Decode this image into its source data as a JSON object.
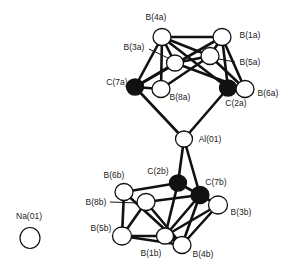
{
  "figure": {
    "type": "molecular-structure",
    "colors": {
      "bond": "#111111",
      "boron_fill": "#ffffff",
      "carbon_fill": "#111111",
      "stroke": "#111111"
    },
    "atoms": [
      {
        "id": "B4a",
        "label": "B(4a)",
        "element": "B",
        "x": 162,
        "y": 37,
        "r": 8.5,
        "lx": 156,
        "ly": 17
      },
      {
        "id": "B1a",
        "label": "B(1a)",
        "element": "B",
        "x": 222,
        "y": 37,
        "r": 8.5,
        "lx": 250,
        "ly": 35
      },
      {
        "id": "B3a",
        "label": "B(3a)",
        "element": "B",
        "x": 175,
        "y": 63,
        "r": 8,
        "lx": 134,
        "ly": 47
      },
      {
        "id": "B5a",
        "label": "B(5a)",
        "element": "B",
        "x": 210,
        "y": 56,
        "r": 8.5,
        "lx": 250,
        "ly": 62
      },
      {
        "id": "C7a",
        "label": "C(7a)",
        "element": "C",
        "x": 135,
        "y": 87,
        "r": 8,
        "lx": 117,
        "ly": 82
      },
      {
        "id": "B8a",
        "label": "B(8a)",
        "element": "B",
        "x": 161,
        "y": 89,
        "r": 8.5,
        "lx": 180,
        "ly": 97
      },
      {
        "id": "C2a",
        "label": "C(2a)",
        "element": "C",
        "x": 228,
        "y": 88,
        "r": 8,
        "lx": 236,
        "ly": 103
      },
      {
        "id": "B6a",
        "label": "B(6a)",
        "element": "B",
        "x": 245,
        "y": 89,
        "r": 8.5,
        "lx": 268,
        "ly": 93
      },
      {
        "id": "Al01",
        "label": "Al(01)",
        "element": "Al",
        "x": 184,
        "y": 139,
        "r": 8,
        "lx": 210,
        "ly": 139
      },
      {
        "id": "C2b",
        "label": "C(2b)",
        "element": "C",
        "x": 178,
        "y": 183,
        "r": 8,
        "lx": 158,
        "ly": 171
      },
      {
        "id": "C7b",
        "label": "C(7b)",
        "element": "C",
        "x": 200,
        "y": 195,
        "r": 8.5,
        "lx": 216,
        "ly": 182
      },
      {
        "id": "B3b",
        "label": "B(3b)",
        "element": "B",
        "x": 218,
        "y": 205,
        "r": 9,
        "lx": 241,
        "ly": 212
      },
      {
        "id": "B6b",
        "label": "B(6b)",
        "element": "B",
        "x": 124,
        "y": 192,
        "r": 8.5,
        "lx": 114,
        "ly": 175
      },
      {
        "id": "B8b",
        "label": "B(8b)",
        "element": "B",
        "x": 146,
        "y": 202,
        "r": 8.5,
        "lx": 96,
        "ly": 202
      },
      {
        "id": "B5b",
        "label": "B(5b)",
        "element": "B",
        "x": 122,
        "y": 236,
        "r": 9,
        "lx": 101,
        "ly": 228
      },
      {
        "id": "B1b",
        "label": "B(1b)",
        "element": "B",
        "x": 165,
        "y": 236,
        "r": 8,
        "lx": 151,
        "ly": 253
      },
      {
        "id": "B4b",
        "label": "B(4b)",
        "element": "B",
        "x": 182,
        "y": 245,
        "r": 8.5,
        "lx": 203,
        "ly": 254
      },
      {
        "id": "Na01",
        "label": "Na(01)",
        "element": "Na",
        "x": 30,
        "y": 238,
        "r": 10.5,
        "lx": 29,
        "ly": 216
      }
    ],
    "bonds": [
      [
        "B4a",
        "B1a"
      ],
      [
        "B4a",
        "B3a"
      ],
      [
        "B4a",
        "C7a"
      ],
      [
        "B4a",
        "B8a"
      ],
      [
        "B4a",
        "B5a"
      ],
      [
        "B4a",
        "C2a"
      ],
      [
        "B1a",
        "B5a"
      ],
      [
        "B1a",
        "C2a"
      ],
      [
        "B1a",
        "B6a"
      ],
      [
        "B1a",
        "C7a"
      ],
      [
        "B3a",
        "C7a"
      ],
      [
        "B3a",
        "B5a"
      ],
      [
        "B3a",
        "B6a"
      ],
      [
        "B5a",
        "B8a"
      ],
      [
        "B5a",
        "B6a"
      ],
      [
        "C7a",
        "B8a"
      ],
      [
        "C2a",
        "B6a"
      ],
      [
        "C7a",
        "Al01"
      ],
      [
        "C2a",
        "Al01"
      ],
      [
        "Al01",
        "C2b"
      ],
      [
        "Al01",
        "C7b"
      ],
      [
        "C2b",
        "C7b"
      ],
      [
        "C2b",
        "B6b"
      ],
      [
        "C2b",
        "B1b"
      ],
      [
        "C7b",
        "B8b"
      ],
      [
        "C7b",
        "B3b"
      ],
      [
        "C7b",
        "B4b"
      ],
      [
        "C7b",
        "B1b"
      ],
      [
        "B3b",
        "B4b"
      ],
      [
        "B3b",
        "B1b"
      ],
      [
        "B6b",
        "B5b"
      ],
      [
        "B6b",
        "B4b"
      ],
      [
        "B8b",
        "B5b"
      ],
      [
        "B8b",
        "B4b"
      ],
      [
        "B5b",
        "B1b"
      ],
      [
        "B5b",
        "B4b"
      ],
      [
        "B1b",
        "B4b"
      ]
    ],
    "leader_lines": [
      {
        "label": "B(3a)",
        "x1": 149,
        "y1": 49,
        "x2": 168,
        "y2": 58
      },
      {
        "label": "B(5a)",
        "x1": 219,
        "y1": 59,
        "x2": 235,
        "y2": 62
      },
      {
        "label": "B(8b)",
        "x1": 110,
        "y1": 202,
        "x2": 138,
        "y2": 203
      }
    ]
  }
}
